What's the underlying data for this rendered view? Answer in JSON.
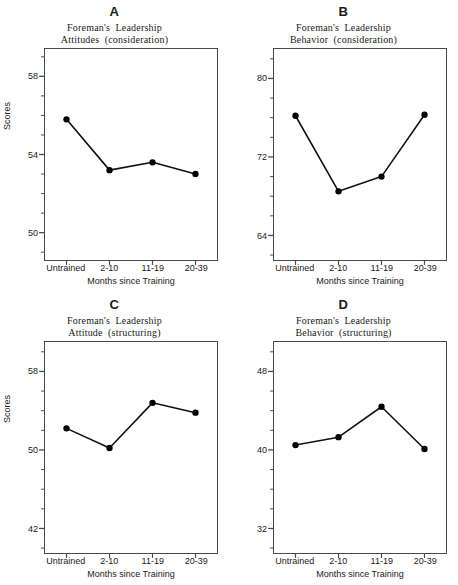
{
  "figure": {
    "shared": {
      "ylabel": "Scores",
      "xlabel": "Months since Training",
      "categories": [
        "Untrained",
        "2-10",
        "11-19",
        "20-39"
      ],
      "line_color": "#111111",
      "marker_color": "#000000",
      "frame_color": "#4a4a4a"
    },
    "panels": [
      {
        "letter": "A",
        "title_line1": "Foreman's  Leadership",
        "title_line2": "Attitudes  (consideration)",
        "ylabel": "Scores",
        "xlabel": "Months since Training",
        "yticks": [
          50,
          54,
          58
        ],
        "ytick_labels": [
          "50",
          "54",
          "58"
        ],
        "ylim": [
          48.6,
          59.4
        ],
        "minor_step": 1,
        "values": [
          55.8,
          53.2,
          53.6,
          53.0
        ]
      },
      {
        "letter": "B",
        "title_line1": "Foreman's  Leadership",
        "title_line2": "Behavior  (consideration)",
        "ylabel": "Scores",
        "xlabel": "Months since Training",
        "yticks": [
          64,
          72,
          80
        ],
        "ytick_labels": [
          "64",
          "72",
          "80"
        ],
        "ylim": [
          61.5,
          83.0
        ],
        "minor_step": 2,
        "values": [
          76.2,
          68.5,
          70.0,
          76.3
        ]
      },
      {
        "letter": "C",
        "title_line1": "Foreman's  Leadership",
        "title_line2": "Attitude  (structuring)",
        "ylabel": "Scores",
        "xlabel": "Months since Training",
        "yticks": [
          42,
          50,
          58
        ],
        "ytick_labels": [
          "42",
          "50",
          "58"
        ],
        "ylim": [
          39.5,
          61.0
        ],
        "minor_step": 2,
        "values": [
          52.2,
          50.2,
          54.8,
          53.8
        ]
      },
      {
        "letter": "D",
        "title_line1": "Foreman's  Leadership",
        "title_line2": "Behavior  (structuring)",
        "ylabel": "Scores",
        "xlabel": "Months since Training",
        "yticks": [
          32,
          40,
          48
        ],
        "ytick_labels": [
          "32",
          "40",
          "48"
        ],
        "ylim": [
          29.5,
          51.0
        ],
        "minor_step": 2,
        "values": [
          40.5,
          41.3,
          44.4,
          40.1
        ]
      }
    ]
  },
  "chart_data": [
    {
      "type": "line",
      "panel": "A",
      "title": "Foreman's Leadership Attitudes (consideration)",
      "xlabel": "Months since Training",
      "ylabel": "Scores",
      "categories": [
        "Untrained",
        "2-10",
        "11-19",
        "20-39"
      ],
      "values": [
        55.8,
        53.2,
        53.6,
        53.0
      ],
      "yticks": [
        50,
        54,
        58
      ],
      "ylim": [
        48.6,
        59.4
      ],
      "grid": false,
      "legend": "none"
    },
    {
      "type": "line",
      "panel": "B",
      "title": "Foreman's Leadership Behavior (consideration)",
      "xlabel": "Months since Training",
      "ylabel": "Scores",
      "categories": [
        "Untrained",
        "2-10",
        "11-19",
        "20-39"
      ],
      "values": [
        76.2,
        68.5,
        70.0,
        76.3
      ],
      "yticks": [
        64,
        72,
        80
      ],
      "ylim": [
        61.5,
        83.0
      ],
      "grid": false,
      "legend": "none"
    },
    {
      "type": "line",
      "panel": "C",
      "title": "Foreman's Leadership Attitude (structuring)",
      "xlabel": "Months since Training",
      "ylabel": "Scores",
      "categories": [
        "Untrained",
        "2-10",
        "11-19",
        "20-39"
      ],
      "values": [
        52.2,
        50.2,
        54.8,
        53.8
      ],
      "yticks": [
        42,
        50,
        58
      ],
      "ylim": [
        39.5,
        61.0
      ],
      "grid": false,
      "legend": "none"
    },
    {
      "type": "line",
      "panel": "D",
      "title": "Foreman's Leadership Behavior (structuring)",
      "xlabel": "Months since Training",
      "ylabel": "Scores",
      "categories": [
        "Untrained",
        "2-10",
        "11-19",
        "20-39"
      ],
      "values": [
        40.5,
        41.3,
        44.4,
        40.1
      ],
      "yticks": [
        32,
        40,
        48
      ],
      "ylim": [
        29.5,
        51.0
      ],
      "grid": false,
      "legend": "none"
    }
  ]
}
